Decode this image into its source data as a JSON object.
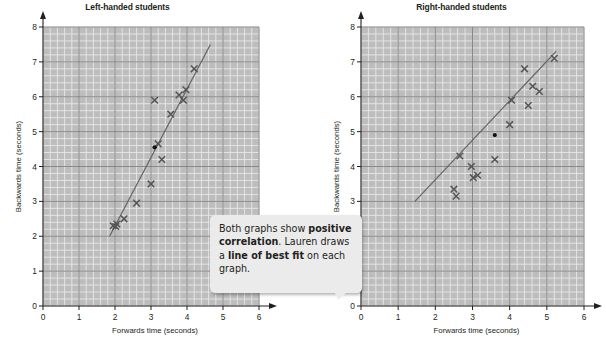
{
  "callout": {
    "text_parts": [
      {
        "text": "Both graphs show ",
        "bold": false
      },
      {
        "text": "positive correlation",
        "bold": true
      },
      {
        "text": ". Lauren draws a ",
        "bold": false
      },
      {
        "text": "line of best fit",
        "bold": true
      },
      {
        "text": " on each graph.",
        "bold": false
      }
    ],
    "plain_text": "Both graphs show positive correlation. Lauren draws a line of best fit on each graph."
  },
  "colors": {
    "grid_background": "#bdbdbd",
    "grid_minor": "#e8e8e8",
    "grid_major": "#6e6e6e",
    "axis": "#231f20",
    "marker": "#555555",
    "best_fit_line": "#666666",
    "callout_background": "#ebebeb",
    "text": "#231f20"
  },
  "chart_data": [
    {
      "type": "scatter",
      "title": "Left-handed students",
      "xlabel": "Forwards time (seconds)",
      "ylabel": "Backwards time (seconds)",
      "xlim": [
        0,
        6
      ],
      "ylim": [
        0,
        8
      ],
      "xticks": [
        0,
        1,
        2,
        3,
        4,
        5,
        6
      ],
      "yticks": [
        0,
        1,
        2,
        3,
        4,
        5,
        6,
        7,
        8
      ],
      "grid": true,
      "grid_minor_step": 0.2,
      "legend": null,
      "marker": "x",
      "points": [
        [
          1.95,
          2.3
        ],
        [
          2.05,
          2.35
        ],
        [
          2.02,
          2.28
        ],
        [
          2.25,
          2.5
        ],
        [
          2.6,
          2.95
        ],
        [
          3.0,
          3.5
        ],
        [
          3.1,
          5.9
        ],
        [
          3.2,
          4.65
        ],
        [
          3.3,
          4.2
        ],
        [
          3.55,
          5.5
        ],
        [
          3.78,
          6.05
        ],
        [
          3.9,
          5.9
        ],
        [
          3.97,
          6.2
        ],
        [
          4.2,
          6.8
        ]
      ],
      "mean_point": [
        3.1,
        4.55
      ],
      "best_fit_line": {
        "x1": 1.85,
        "y1": 2.0,
        "x2": 4.65,
        "y2": 7.5
      }
    },
    {
      "type": "scatter",
      "title": "Right-handed students",
      "xlabel": "Forwards time (seconds)",
      "ylabel": "Backwards time (seconds)",
      "xlim": [
        0,
        6
      ],
      "ylim": [
        0,
        8
      ],
      "xticks": [
        0,
        1,
        2,
        3,
        4,
        5,
        6
      ],
      "yticks": [
        0,
        1,
        2,
        3,
        4,
        5,
        6,
        7,
        8
      ],
      "grid": true,
      "grid_minor_step": 0.2,
      "legend": null,
      "marker": "x",
      "points": [
        [
          2.5,
          3.35
        ],
        [
          2.56,
          3.15
        ],
        [
          2.66,
          4.3
        ],
        [
          2.97,
          4.0
        ],
        [
          3.02,
          3.68
        ],
        [
          3.14,
          3.75
        ],
        [
          3.6,
          4.2
        ],
        [
          4.0,
          5.2
        ],
        [
          4.05,
          5.9
        ],
        [
          4.4,
          6.8
        ],
        [
          4.5,
          5.75
        ],
        [
          4.62,
          6.3
        ],
        [
          4.8,
          6.15
        ],
        [
          5.2,
          7.1
        ]
      ],
      "mean_point": [
        3.6,
        4.9
      ],
      "best_fit_line": {
        "x1": 1.45,
        "y1": 3.0,
        "x2": 5.25,
        "y2": 7.3
      }
    }
  ]
}
